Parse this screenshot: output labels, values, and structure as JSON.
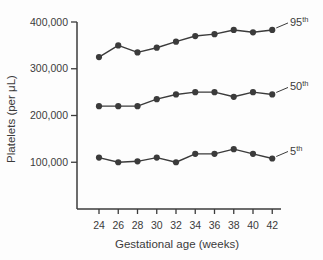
{
  "figure": {
    "background": "#fdfdfd",
    "ink_color": "#3b3b3b"
  },
  "chart_data": {
    "type": "line",
    "x": [
      24,
      26,
      28,
      30,
      32,
      34,
      36,
      38,
      40,
      42
    ],
    "xlabel": "Gestational age (weeks)",
    "ylabel": "Platelets (per μL)",
    "ylim": [
      0,
      400000
    ],
    "yticks": [
      100000,
      200000,
      300000,
      400000
    ],
    "ytick_labels": [
      "100,000",
      "200,000",
      "300,000",
      "400,000"
    ],
    "grid": false,
    "legend_position": "right-end-of-line-labels",
    "line_color": "#3b3b3b",
    "marker": "circle",
    "series": [
      {
        "name": "95th",
        "label_base": "95",
        "label_sup": "th",
        "values": [
          325000,
          350000,
          335000,
          345000,
          358000,
          370000,
          374000,
          383000,
          378000,
          383000
        ]
      },
      {
        "name": "50th",
        "label_base": "50",
        "label_sup": "th",
        "values": [
          220000,
          220000,
          220000,
          235000,
          245000,
          250000,
          250000,
          240000,
          250000,
          245000
        ]
      },
      {
        "name": "5th",
        "label_base": "5",
        "label_sup": "th",
        "values": [
          110000,
          100000,
          102000,
          110000,
          100000,
          118000,
          118000,
          128000,
          118000,
          108000
        ]
      }
    ]
  }
}
